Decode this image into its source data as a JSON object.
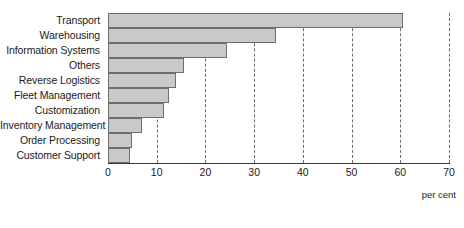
{
  "chart_data": {
    "type": "bar",
    "orientation": "horizontal",
    "title": "",
    "xlabel": "per cent",
    "ylabel": "",
    "xlim": [
      0,
      70
    ],
    "xticks": [
      0,
      10,
      20,
      30,
      40,
      50,
      60,
      70
    ],
    "grid": true,
    "grid_axis": "x",
    "grid_style": "dashed",
    "legend": false,
    "categories": [
      "Transport",
      "Warehousing",
      "Information Systems",
      "Others",
      "Reverse Logistics",
      "Fleet Management",
      "Customization",
      "Inventory Management",
      "Order Processing",
      "Customer Support"
    ],
    "values": [
      60.5,
      34.5,
      24.5,
      15.5,
      14,
      12.5,
      11.5,
      7,
      5,
      4.5
    ],
    "colors": {
      "bar_fill": "#c9c9c9",
      "bar_border": "#6e6e6e",
      "axis": "#3a3a3a",
      "grid": "#6a6a6a",
      "text": "#1a1a1a",
      "background": "#ffffff"
    }
  }
}
